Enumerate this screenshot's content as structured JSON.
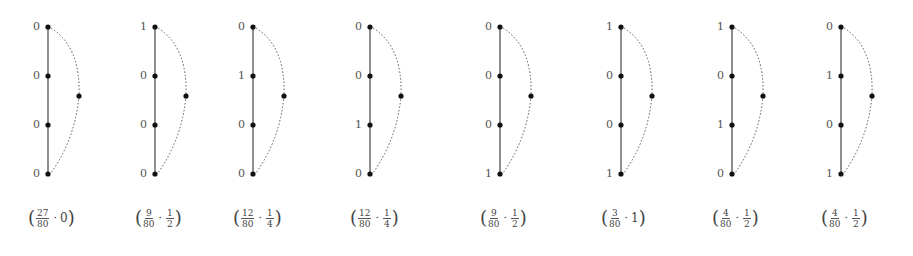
{
  "diagrams": [
    {
      "x": 48,
      "labels": [
        "0",
        "0",
        "0",
        "0"
      ],
      "caption": {
        "num": "27",
        "den": "80",
        "value_frac": false,
        "value": "0"
      }
    },
    {
      "x": 155,
      "labels": [
        "1",
        "0",
        "0",
        "0"
      ],
      "caption": {
        "num": "9",
        "den": "80",
        "value_frac": true,
        "vnum": "1",
        "vden": "2"
      }
    },
    {
      "x": 253,
      "labels": [
        "0",
        "1",
        "0",
        "0"
      ],
      "caption": {
        "num": "12",
        "den": "80",
        "value_frac": true,
        "vnum": "1",
        "vden": "4"
      }
    },
    {
      "x": 370,
      "labels": [
        "0",
        "0",
        "1",
        "0"
      ],
      "caption": {
        "num": "12",
        "den": "80",
        "value_frac": true,
        "vnum": "1",
        "vden": "4"
      }
    },
    {
      "x": 500,
      "labels": [
        "0",
        "0",
        "0",
        "1"
      ],
      "caption": {
        "num": "9",
        "den": "80",
        "value_frac": true,
        "vnum": "1",
        "vden": "2"
      }
    },
    {
      "x": 621,
      "labels": [
        "1",
        "0",
        "0",
        "1"
      ],
      "caption": {
        "num": "3",
        "den": "80",
        "value_frac": false,
        "value": "1"
      }
    },
    {
      "x": 732,
      "labels": [
        "1",
        "0",
        "1",
        "0"
      ],
      "caption": {
        "num": "4",
        "den": "80",
        "value_frac": true,
        "vnum": "1",
        "vden": "2"
      }
    },
    {
      "x": 841,
      "labels": [
        "0",
        "1",
        "0",
        "1"
      ],
      "caption": {
        "num": "4",
        "den": "80",
        "value_frac": true,
        "vnum": "1",
        "vden": "2"
      }
    }
  ],
  "geometry": {
    "top_y": 27,
    "bottom_y": 174,
    "right_offset": 31
  },
  "colors": {
    "line": "#444444",
    "node": "#111111",
    "dotted": "#555555"
  }
}
